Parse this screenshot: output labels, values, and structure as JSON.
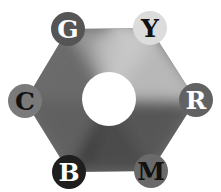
{
  "diagram": {
    "nodes": [
      {
        "id": "G",
        "label": "G",
        "cx": 68,
        "cy": 29,
        "fill": "#555555",
        "text": "#ffffff"
      },
      {
        "id": "Y",
        "label": "Y",
        "cx": 150,
        "cy": 28,
        "fill": "#dcdcdc",
        "text": "#111111"
      },
      {
        "id": "R",
        "label": "R",
        "cx": 196,
        "cy": 100,
        "fill": "#626262",
        "text": "#ffffff"
      },
      {
        "id": "M",
        "label": "M",
        "cx": 151,
        "cy": 171,
        "fill": "#6a6a6a",
        "text": "#111111"
      },
      {
        "id": "B",
        "label": "B",
        "cx": 69,
        "cy": 172,
        "fill": "#1e1e1e",
        "text": "#ffffff"
      },
      {
        "id": "C",
        "label": "C",
        "cx": 25,
        "cy": 101,
        "fill": "#7a7a7a",
        "text": "#111111"
      }
    ],
    "center_hole": {
      "cx": 109,
      "cy": 99,
      "r": 27
    }
  }
}
